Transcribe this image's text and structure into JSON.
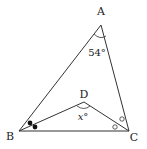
{
  "diagram": {
    "type": "geometry-triangle",
    "stroke_color": "#333333",
    "vertices": {
      "A": {
        "label": "A",
        "x": 101,
        "y": 25,
        "lx": 101,
        "ly": 15
      },
      "B": {
        "label": "B",
        "x": 19,
        "y": 131,
        "lx": 10,
        "ly": 140
      },
      "C": {
        "label": "C",
        "x": 129,
        "y": 131,
        "lx": 134,
        "ly": 141
      },
      "D": {
        "label": "D",
        "x": 84,
        "y": 102,
        "lx": 84,
        "ly": 98
      }
    },
    "angles": {
      "A": {
        "text": "54°",
        "x": 97,
        "y": 56
      },
      "D": {
        "text": "x°",
        "x": 83,
        "y": 120
      }
    },
    "marks": {
      "B_bisector": "filled-dots",
      "C_bisector": "open-circles"
    }
  }
}
